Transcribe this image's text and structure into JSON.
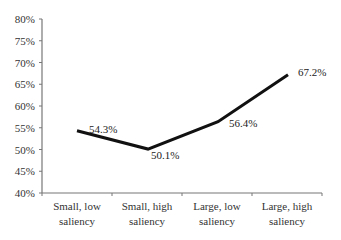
{
  "chart_data": {
    "type": "line",
    "title": "",
    "xlabel": "",
    "ylabel": "",
    "categories": [
      [
        "Small, low",
        "saliency"
      ],
      [
        "Small, high",
        "saliency"
      ],
      [
        "Large, low",
        "saliency"
      ],
      [
        "Large, high",
        "saliency"
      ]
    ],
    "category_names": [
      "Small, low saliency",
      "Small, high saliency",
      "Large, low saliency",
      "Large, high saliency"
    ],
    "series": [
      {
        "name": "",
        "values": [
          54.3,
          50.1,
          56.4,
          67.2
        ],
        "color": "#111111"
      }
    ],
    "data_labels": [
      "54.3%",
      "50.1%",
      "56.4%",
      "67.2%"
    ],
    "ylim": [
      40,
      80
    ],
    "yticks": [
      40,
      45,
      50,
      55,
      60,
      65,
      70,
      75,
      80
    ],
    "ytick_labels": [
      "40%",
      "45%",
      "50%",
      "55%",
      "60%",
      "65%",
      "70%",
      "75%",
      "80%"
    ],
    "grid": false,
    "legend": "none"
  }
}
